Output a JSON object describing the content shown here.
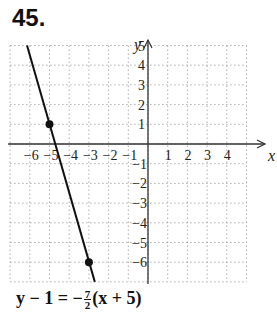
{
  "problem_number": "45.",
  "chart_data": {
    "type": "line",
    "title": "",
    "xlabel": "x",
    "ylabel": "y",
    "xlim": [
      -7,
      5
    ],
    "ylim": [
      -7,
      6
    ],
    "grid": true,
    "x_ticks": [
      -6,
      -5,
      -4,
      -3,
      -2,
      -1,
      1,
      2,
      3,
      4
    ],
    "y_ticks": [
      5,
      4,
      3,
      2,
      1,
      -1,
      -2,
      -3,
      -4,
      -5,
      -6
    ],
    "series": [
      {
        "name": "y - 1 = -7/2(x + 5)",
        "slope": -3.5,
        "points": [
          {
            "x": -5,
            "y": 1
          },
          {
            "x": -3,
            "y": -6
          }
        ],
        "line_extent": [
          {
            "x": -6.14,
            "y": 5
          },
          {
            "x": -2.7,
            "y": -7
          }
        ]
      }
    ]
  },
  "equation": {
    "lhs": "y − 1 = −",
    "num": "7",
    "den": "2",
    "rhs": "(x + 5)"
  }
}
